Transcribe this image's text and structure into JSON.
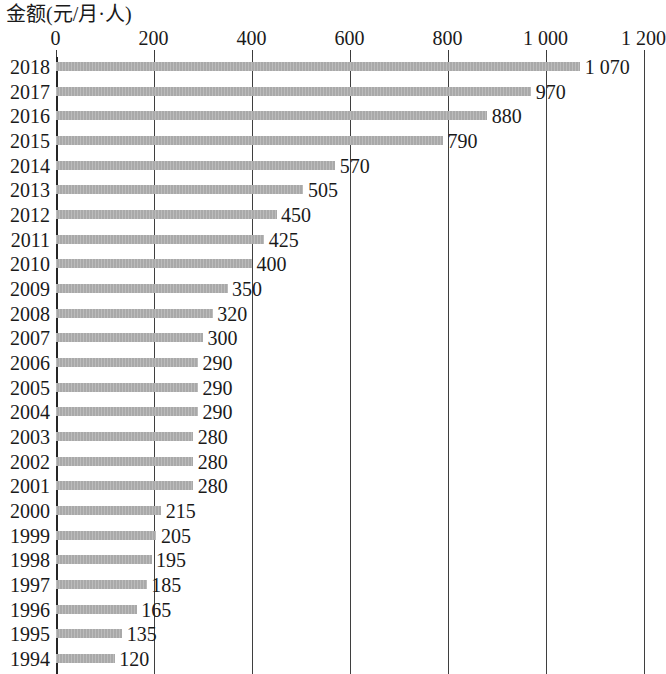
{
  "chart_data": {
    "type": "bar",
    "orientation": "horizontal",
    "title": "金额(元/月·人)",
    "xlabel": "",
    "ylabel": "",
    "xlim": [
      0,
      1200
    ],
    "xticks": [
      0,
      200,
      400,
      600,
      800,
      1000,
      1200
    ],
    "xtick_labels": [
      "0",
      "200",
      "400",
      "600",
      "800",
      "1 000",
      "1 200"
    ],
    "grid": true,
    "legend": false,
    "bar_color": "#a9a9a9",
    "axis_color": "#3f3f3f",
    "categories": [
      "2018",
      "2017",
      "2016",
      "2015",
      "2014",
      "2013",
      "2012",
      "2011",
      "2010",
      "2009",
      "2008",
      "2007",
      "2006",
      "2005",
      "2004",
      "2003",
      "2002",
      "2001",
      "2000",
      "1999",
      "1998",
      "1997",
      "1996",
      "1995",
      "1994"
    ],
    "values": [
      1070,
      970,
      880,
      790,
      570,
      505,
      450,
      425,
      400,
      350,
      320,
      300,
      290,
      290,
      290,
      280,
      280,
      280,
      215,
      205,
      195,
      185,
      165,
      135,
      120
    ],
    "value_labels": [
      "1 070",
      "970",
      "880",
      "790",
      "570",
      "505",
      "450",
      "425",
      "400",
      "350",
      "320",
      "300",
      "290",
      "290",
      "290",
      "280",
      "280",
      "280",
      "215",
      "205",
      "195",
      "185",
      "165",
      "135",
      "120"
    ],
    "note": "Chart is cropped at the bottom; the 1994 row is the last visible category."
  }
}
